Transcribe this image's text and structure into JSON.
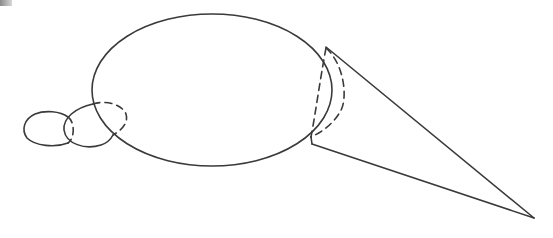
{
  "diagram": {
    "colors": {
      "stroke": "#3a3a3a",
      "background": "#ffffff"
    },
    "shapes": {
      "main_ellipse": {
        "cx": 212,
        "cy": 90,
        "rx": 120,
        "ry": 76
      },
      "cone": {
        "apex": [
          534,
          218
        ],
        "base_top": [
          326,
          48
        ],
        "base_bottom": [
          312,
          144
        ]
      },
      "mid_ellipse": {
        "cx": 95,
        "cy": 125,
        "rx": 32,
        "ry": 23
      },
      "small_ellipse": {
        "cx": 46,
        "cy": 129,
        "rx": 23,
        "ry": 17
      }
    },
    "labels": []
  }
}
